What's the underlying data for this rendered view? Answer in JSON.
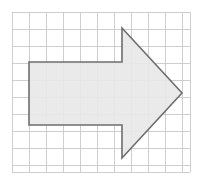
{
  "canvas": {
    "width": 203,
    "height": 184,
    "background_color": "#ffffff"
  },
  "grid": {
    "label": "square-grid",
    "origin_x": 12,
    "origin_y": 12,
    "cell_size": 17,
    "columns": 10,
    "rows": 9,
    "extra_col_fraction": 0.47,
    "extra_row_fraction": 0.41,
    "right_edge": 190,
    "bottom_edge": 172,
    "line_color": "#c9c9c9",
    "line_width": 0.9
  },
  "shape": {
    "label": "right-pointing-block-arrow",
    "fill_color": "#e8e8e8",
    "stroke_color": "#6e6e6e",
    "stroke_width": 1.6,
    "points": "29,62 122,62 122,28 182,93 122,158 122,125 29,125",
    "vertices": [
      {
        "name": "rect-top-left",
        "x": 29,
        "y": 62
      },
      {
        "name": "rect-top-right-notch",
        "x": 122,
        "y": 62
      },
      {
        "name": "triangle-apex-top",
        "x": 122,
        "y": 28
      },
      {
        "name": "arrow-tip",
        "x": 182,
        "y": 93
      },
      {
        "name": "triangle-apex-bottom",
        "x": 122,
        "y": 158
      },
      {
        "name": "rect-bottom-right-notch",
        "x": 122,
        "y": 125
      },
      {
        "name": "rect-bottom-left",
        "x": 29,
        "y": 125
      }
    ]
  }
}
